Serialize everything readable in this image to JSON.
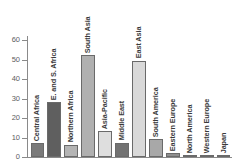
{
  "chart_data": {
    "type": "bar",
    "title": "",
    "subtitle": "",
    "xlabel": "",
    "ylabel": "",
    "ylim": [
      0,
      60
    ],
    "yticks": [
      0,
      10,
      20,
      30,
      40,
      50,
      60
    ],
    "ytick_labels": [
      "0",
      "10",
      "20",
      "30",
      "40",
      "50",
      "60"
    ],
    "grid": false,
    "legend": "none",
    "categories": [
      "Central Africa",
      "E. and S. Africa",
      "Northern Africa",
      "South Asia",
      "Asia-Pacific",
      "Middle East",
      "East Asia",
      "South America",
      "Eastern Europe",
      "North America",
      "Western Europe",
      "Japan"
    ],
    "values": [
      7.2,
      28.2,
      6.4,
      52.3,
      13.4,
      7.4,
      49.4,
      9.2,
      2.0,
      1.0,
      1.0,
      1.0
    ],
    "bar_colors": [
      "#7a7a7a",
      "#5f5f5f",
      "#b4b4b4",
      "#b0b0b0",
      "#dedede",
      "#727272",
      "#d9d9d9",
      "#a8a8a8",
      "#8e8e8e",
      "#9a9a9a",
      "#b4b4b4",
      "#9a9a9a"
    ],
    "axis_color": "#8a8a8a",
    "label_color": "#3a3a3a",
    "tick_label_color": "#5d5d5d",
    "background_color": "#ffffff"
  }
}
